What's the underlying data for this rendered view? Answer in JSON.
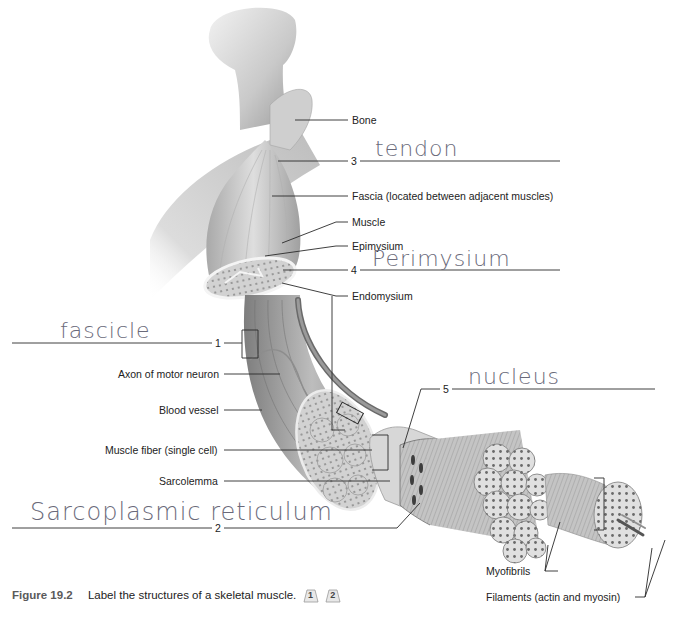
{
  "figure": {
    "number": "Figure 19.2",
    "caption": "Label the structures of a skeletal muscle.",
    "badges": [
      "1",
      "2"
    ]
  },
  "printed_labels": {
    "bone": "Bone",
    "fascia": "Fascia (located between adjacent muscles)",
    "muscle": "Muscle",
    "epimysium": "Epimysium",
    "endomysium": "Endomysium",
    "axon": "Axon of motor neuron",
    "blood_vessel": "Blood vessel",
    "muscle_fiber": "Muscle fiber (single cell)",
    "sarcolemma": "Sarcolemma",
    "myofibrils": "Myofibrils",
    "filaments": "Filaments (actin and myosin)"
  },
  "blanks": [
    {
      "number": "1",
      "answer": "fascicle"
    },
    {
      "number": "2",
      "answer": "Sarcoplasmic reticulum"
    },
    {
      "number": "3",
      "answer": "tendon"
    },
    {
      "number": "4",
      "answer": "Perimysium"
    },
    {
      "number": "5",
      "answer": "nucleus"
    }
  ],
  "colors": {
    "line": "#2a2a2a",
    "handwriting": "#6a6a7a",
    "tissue_light": "#e4e4e4",
    "tissue_mid": "#b5b5b5",
    "tissue_dark": "#7a7a7a"
  }
}
